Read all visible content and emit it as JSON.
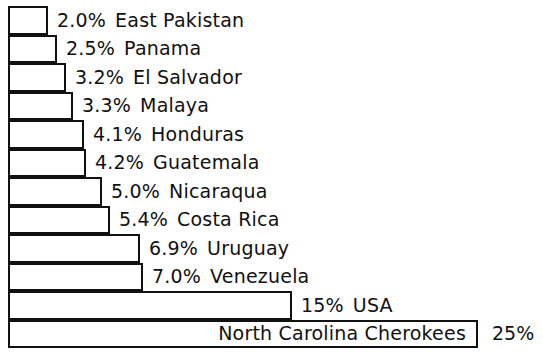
{
  "chart_data": {
    "type": "bar",
    "orientation": "horizontal",
    "title": "",
    "subtitle": "",
    "xlabel": "",
    "ylabel": "",
    "legend": null,
    "grid": false,
    "xlim": [
      0,
      25
    ],
    "unit": "%",
    "categories": [
      "East Pakistan",
      "Panama",
      "El Salvador",
      "Malaya",
      "Honduras",
      "Guatemala",
      "Nicaraqua",
      "Costa Rica",
      "Uruguay",
      "Venezuela",
      "USA",
      "North Carolina Cherokees"
    ],
    "values": [
      2.0,
      2.5,
      3.2,
      3.3,
      4.1,
      4.2,
      5.0,
      5.4,
      6.9,
      7.0,
      15,
      25
    ],
    "value_labels": [
      "2.0%",
      "2.5%",
      "3.2%",
      "3.3%",
      "4.1%",
      "4.2%",
      "5.0%",
      "5.4%",
      "6.9%",
      "7.0%",
      "15%",
      "25%"
    ]
  },
  "rows": [
    {
      "pct": "2.0%",
      "name": "East Pakistan",
      "value": 2.0
    },
    {
      "pct": "2.5%",
      "name": "Panama",
      "value": 2.5
    },
    {
      "pct": "3.2%",
      "name": "El Salvador",
      "value": 3.2
    },
    {
      "pct": "3.3%",
      "name": "Malaya",
      "value": 3.3
    },
    {
      "pct": "4.1%",
      "name": "Honduras",
      "value": 4.1
    },
    {
      "pct": "4.2%",
      "name": "Guatemala",
      "value": 4.2
    },
    {
      "pct": "5.0%",
      "name": "Nicaraqua",
      "value": 5.0
    },
    {
      "pct": "5.4%",
      "name": "Costa Rica",
      "value": 5.4
    },
    {
      "pct": "6.9%",
      "name": "Uruguay",
      "value": 6.9
    },
    {
      "pct": "7.0%",
      "name": "Venezuela",
      "value": 7.0
    },
    {
      "pct": "15%",
      "name": "USA",
      "value": 15
    },
    {
      "pct": "25%",
      "name": "North Carolina Cherokees",
      "value": 25
    }
  ],
  "style": {
    "bar_stroke": "#111111",
    "bar_fill": "#ffffff",
    "text_color": "#111111",
    "background": "#ffffff"
  }
}
